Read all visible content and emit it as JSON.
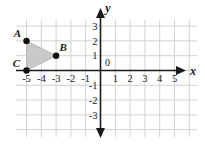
{
  "figure": {
    "partial_marker": ")",
    "axis_labels": {
      "x": "x",
      "y": "y"
    },
    "origin_label": "0",
    "x_ticks": [
      "-5",
      "-4",
      "-3",
      "-2",
      "-1",
      "1",
      "2",
      "3",
      "4",
      "5"
    ],
    "y_ticks": [
      "3",
      "2",
      "1",
      "-1",
      "-2",
      "-3"
    ],
    "point_labels": [
      "A",
      "B",
      "C"
    ],
    "colors": {
      "grid": "#cfd2d6",
      "axis": "#1a1a1a",
      "shape_fill": "#c9c9c9",
      "shape_stroke": "#b5b5b5",
      "point": "#111111",
      "text": "#1a1a1a"
    }
  },
  "chart_data": {
    "type": "scatter",
    "title": "",
    "xlabel": "x",
    "ylabel": "y",
    "xlim": [
      -6,
      6
    ],
    "ylim": [
      -4,
      4
    ],
    "xticks": [
      -5,
      -4,
      -3,
      -2,
      -1,
      1,
      2,
      3,
      4,
      5
    ],
    "yticks": [
      3,
      2,
      1,
      -1,
      -2,
      -3
    ],
    "grid": true,
    "legend": "none",
    "annotations": [
      {
        "label": "A",
        "x": -5,
        "y": 2
      },
      {
        "label": "B",
        "x": -3,
        "y": 1
      },
      {
        "label": "C",
        "x": -5,
        "y": 0
      }
    ],
    "series": [
      {
        "name": "triangle ABC",
        "kind": "polygon",
        "points": [
          {
            "label": "A",
            "x": -5,
            "y": 2
          },
          {
            "label": "B",
            "x": -3,
            "y": 1
          },
          {
            "label": "C",
            "x": -5,
            "y": 0
          }
        ]
      }
    ]
  }
}
